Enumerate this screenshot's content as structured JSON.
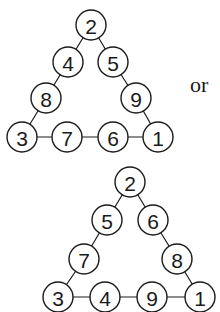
{
  "separator_label": "or",
  "triangles": [
    {
      "name": "triangle-1",
      "nodes": [
        {
          "value": "2",
          "x": 91,
          "y": 25
        },
        {
          "value": "4",
          "x": 68,
          "y": 62
        },
        {
          "value": "5",
          "x": 113,
          "y": 62
        },
        {
          "value": "8",
          "x": 46,
          "y": 98
        },
        {
          "value": "9",
          "x": 136,
          "y": 98
        },
        {
          "value": "3",
          "x": 22,
          "y": 137
        },
        {
          "value": "7",
          "x": 67,
          "y": 137
        },
        {
          "value": "6",
          "x": 113,
          "y": 137
        },
        {
          "value": "1",
          "x": 158,
          "y": 137
        }
      ]
    },
    {
      "name": "triangle-2",
      "nodes": [
        {
          "value": "2",
          "x": 130,
          "y": 182
        },
        {
          "value": "5",
          "x": 107,
          "y": 220
        },
        {
          "value": "6",
          "x": 153,
          "y": 220
        },
        {
          "value": "7",
          "x": 84,
          "y": 259
        },
        {
          "value": "8",
          "x": 177,
          "y": 259
        },
        {
          "value": "3",
          "x": 58,
          "y": 297
        },
        {
          "value": "4",
          "x": 105,
          "y": 297
        },
        {
          "value": "9",
          "x": 152,
          "y": 297
        },
        {
          "value": "1",
          "x": 200,
          "y": 297
        }
      ]
    }
  ],
  "edges": [
    [
      0,
      1
    ],
    [
      0,
      2
    ],
    [
      1,
      3
    ],
    [
      3,
      5
    ],
    [
      2,
      4
    ],
    [
      4,
      8
    ],
    [
      5,
      6
    ],
    [
      6,
      7
    ],
    [
      7,
      8
    ]
  ],
  "node_radius": 15
}
